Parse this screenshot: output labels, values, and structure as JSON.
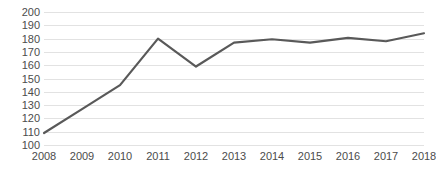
{
  "chart_data": {
    "type": "line",
    "title": "",
    "subtitle": "",
    "xlabel": "",
    "ylabel": "",
    "categories": [
      "2008",
      "2009",
      "2010",
      "2011",
      "2012",
      "2013",
      "2014",
      "2015",
      "2016",
      "2017",
      "2018"
    ],
    "x": [
      2008,
      2009,
      2010,
      2011,
      2012,
      2013,
      2014,
      2015,
      2016,
      2017,
      2018
    ],
    "values": [
      109,
      127,
      145,
      180,
      159,
      177,
      179.5,
      177,
      180.5,
      178,
      184
    ],
    "series": [
      {
        "name": "",
        "values": [
          109,
          127,
          145,
          180,
          159,
          177,
          179.5,
          177,
          180.5,
          178,
          184
        ],
        "color": "#595959"
      }
    ],
    "ylim": [
      100,
      200
    ],
    "yticks": [
      100,
      110,
      120,
      130,
      140,
      150,
      160,
      170,
      180,
      190,
      200
    ],
    "ytick_labels": [
      "100",
      "110",
      "120",
      "130",
      "140",
      "150",
      "160",
      "170",
      "180",
      "190",
      "200"
    ],
    "xlim": [
      2008,
      2018
    ],
    "grid": {
      "horizontal": true,
      "vertical": false,
      "color": "#e2e2e2"
    },
    "legend": {
      "visible": false,
      "position": "none",
      "entries": []
    },
    "line_width": 2.2,
    "markers": false,
    "axis_line": false,
    "background_color": "#ffffff",
    "text_color": "#4c4c4c"
  }
}
